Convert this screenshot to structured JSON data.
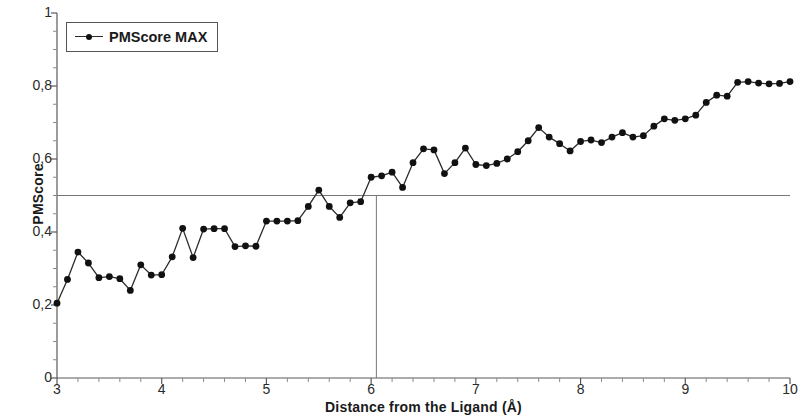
{
  "chart_data": {
    "type": "line",
    "title": "",
    "xlabel": "Distance from the Ligand (Å)",
    "ylabel": "PMScore",
    "xlim": [
      3,
      10
    ],
    "ylim": [
      0,
      1
    ],
    "grid": false,
    "legend_position": "top-left",
    "x_ticks": [
      "3",
      "4",
      "5",
      "6",
      "7",
      "8",
      "9",
      "10"
    ],
    "x_tick_values": [
      3,
      4,
      5,
      6,
      7,
      8,
      9,
      10
    ],
    "x_minor_ticks_per_interval": 5,
    "y_ticks": [
      "0",
      "0,2",
      "0,4",
      "0,6",
      "0,8",
      "1"
    ],
    "y_tick_values": [
      0,
      0.2,
      0.4,
      0.6,
      0.8,
      1
    ],
    "y_minor_ticks_per_interval": 4,
    "marker": "circle",
    "line_color": "#2b2b2b",
    "marker_color": "#111111",
    "reference_lines": [
      {
        "orientation": "horizontal",
        "value": 0.5,
        "color": "#777777",
        "label": ""
      },
      {
        "orientation": "vertical",
        "value": 6.05,
        "color": "#777777",
        "label": ""
      }
    ],
    "series": [
      {
        "name": "PMScore MAX",
        "x": [
          3.0,
          3.1,
          3.2,
          3.3,
          3.4,
          3.5,
          3.6,
          3.7,
          3.8,
          3.9,
          4.0,
          4.1,
          4.2,
          4.3,
          4.4,
          4.5,
          4.6,
          4.7,
          4.8,
          4.9,
          5.0,
          5.1,
          5.2,
          5.3,
          5.4,
          5.5,
          5.6,
          5.7,
          5.8,
          5.9,
          6.0,
          6.1,
          6.2,
          6.3,
          6.4,
          6.5,
          6.6,
          6.7,
          6.8,
          6.9,
          7.0,
          7.1,
          7.2,
          7.3,
          7.4,
          7.5,
          7.6,
          7.7,
          7.8,
          7.9,
          8.0,
          8.1,
          8.2,
          8.3,
          8.4,
          8.5,
          8.6,
          8.7,
          8.8,
          8.9,
          9.0,
          9.1,
          9.2,
          9.3,
          9.4,
          9.5,
          9.6,
          9.7,
          9.8,
          9.9,
          10.0
        ],
        "y": [
          0.205,
          0.27,
          0.345,
          0.315,
          0.275,
          0.278,
          0.272,
          0.24,
          0.31,
          0.282,
          0.283,
          0.332,
          0.41,
          0.33,
          0.408,
          0.409,
          0.409,
          0.36,
          0.362,
          0.361,
          0.43,
          0.43,
          0.43,
          0.431,
          0.47,
          0.515,
          0.47,
          0.44,
          0.48,
          0.483,
          0.55,
          0.554,
          0.564,
          0.522,
          0.59,
          0.628,
          0.625,
          0.56,
          0.59,
          0.63,
          0.585,
          0.582,
          0.588,
          0.6,
          0.62,
          0.65,
          0.686,
          0.66,
          0.642,
          0.622,
          0.648,
          0.652,
          0.645,
          0.66,
          0.672,
          0.66,
          0.664,
          0.69,
          0.71,
          0.706,
          0.71,
          0.72,
          0.755,
          0.775,
          0.772,
          0.81,
          0.812,
          0.808,
          0.806,
          0.807,
          0.812
        ]
      }
    ]
  },
  "legend": {
    "entries": [
      {
        "label": "PMScore MAX"
      }
    ]
  },
  "axes": {
    "y_title": "PMScore",
    "x_title": "Distance from the Ligand (Å)"
  }
}
